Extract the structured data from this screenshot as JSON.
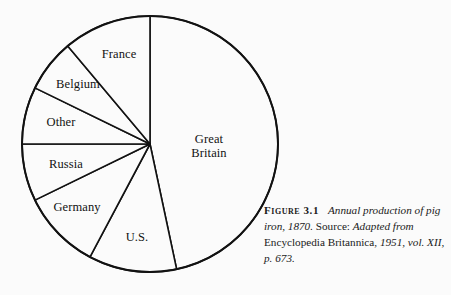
{
  "figure": {
    "number_label": "Figure 3.1",
    "caption_parts": {
      "title_italic": "Annual production of pig iron, 1870.",
      "source_word": " Source: ",
      "source_italic_1": "Adapted from",
      "source_roman": " Encyclopedia Britannica, ",
      "source_italic_2": "1951, vol. XII, p. 673."
    },
    "caption_full": "FIGURE 3.1  Annual production of pig iron, 1870. Source: Adapted from Encyclopedia Britannica, 1951, vol. XII, p. 673."
  },
  "colors": {
    "background": "#fbfbfb",
    "ink": "#121212",
    "slice_fill": "#fbfbfb"
  },
  "chart_data": {
    "type": "pie",
    "title": "Annual production of pig iron, 1870",
    "xlabel": "",
    "ylabel": "",
    "grid": false,
    "legend_position": "none",
    "labels_placement": "inside-slices",
    "start_angle_deg_from_top": 0,
    "direction": "clockwise",
    "unit": "share of world pig iron production (%)",
    "categories": [
      "Great Britain",
      "U.S.",
      "Germany",
      "Russia",
      "Other",
      "Belgium",
      "France"
    ],
    "values": [
      46.7,
      11.1,
      10.0,
      7.2,
      7.2,
      6.7,
      11.1
    ],
    "angles_deg": [
      168,
      40,
      36,
      26,
      26,
      24,
      40
    ],
    "slices": [
      {
        "label": "Great Britain",
        "label_text": "Great\nBritain",
        "value": 46.7,
        "angle_deg": 168,
        "start_deg": 0,
        "end_deg": 168,
        "label_x": 209,
        "label_y": 146
      },
      {
        "label": "U.S.",
        "label_text": "U.S.",
        "value": 11.1,
        "angle_deg": 40,
        "start_deg": 168,
        "end_deg": 208,
        "label_x": 137,
        "label_y": 237
      },
      {
        "label": "Germany",
        "label_text": "Germany",
        "value": 10.0,
        "angle_deg": 36,
        "start_deg": 208,
        "end_deg": 244,
        "label_x": 77,
        "label_y": 207
      },
      {
        "label": "Russia",
        "label_text": "Russia",
        "value": 7.2,
        "angle_deg": 26,
        "start_deg": 244,
        "end_deg": 270,
        "label_x": 66,
        "label_y": 164
      },
      {
        "label": "Other",
        "label_text": "Other",
        "value": 7.2,
        "angle_deg": 26,
        "start_deg": 270,
        "end_deg": 296,
        "label_x": 61,
        "label_y": 122
      },
      {
        "label": "Belgium",
        "label_text": "Belgium",
        "value": 6.7,
        "angle_deg": 24,
        "start_deg": 296,
        "end_deg": 320,
        "label_x": 78,
        "label_y": 84
      },
      {
        "label": "France",
        "label_text": "France",
        "value": 11.1,
        "angle_deg": 40,
        "start_deg": 320,
        "end_deg": 360,
        "label_x": 119,
        "label_y": 54
      }
    ],
    "geometry": {
      "center_x": 150,
      "center_y": 144,
      "radius": 128
    }
  }
}
